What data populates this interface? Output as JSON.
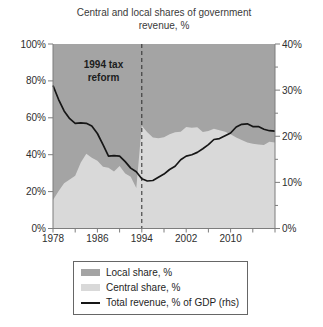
{
  "colors": {
    "background": "#ffffff",
    "local": "#a4a4a4",
    "central": "#d9d9d9",
    "line": "#161616",
    "dashed": "#2b2b2b",
    "axis": "#7d7d7d",
    "text": "#2e2e2e",
    "legend_border": "#666666"
  },
  "chart_data": {
    "type": "area",
    "stacked": true,
    "title": "Central and local shares of government\nrevenue, %",
    "x_range": [
      1978,
      2018
    ],
    "x_step": 1,
    "x_axis": {
      "tick_years": [
        1978,
        1986,
        1994,
        2002,
        2010
      ],
      "tick_labels": [
        "1978",
        "1986",
        "1994",
        "2002",
        "2010"
      ],
      "minor_tick_step_years": 4
    },
    "left_axis": {
      "min": 0,
      "max": 100,
      "tick_step": 20,
      "tick_labels": [
        "0%",
        "20%",
        "40%",
        "60%",
        "80%",
        "100%"
      ]
    },
    "right_axis": {
      "min": 0,
      "max": 40,
      "tick_step": 10,
      "minor_tick_step": 5,
      "tick_labels": [
        "0%",
        "10%",
        "20%",
        "30%",
        "40%"
      ]
    },
    "annotation": {
      "line1": "1994 tax",
      "line2": "reform",
      "year": 1994,
      "marker": "vertical-dashed-line"
    },
    "legend_position": "bottom",
    "series": [
      {
        "name": "Local share, %",
        "role": "area",
        "axis": "left",
        "values": [
          84.5,
          79.8,
          75.5,
          73.5,
          71.4,
          64.2,
          59.5,
          61.6,
          63.3,
          66.5,
          67.1,
          69.1,
          66.2,
          70.2,
          71.9,
          78.0,
          44.3,
          47.8,
          50.6,
          51.1,
          50.5,
          48.9,
          47.8,
          47.6,
          45.0,
          45.4,
          45.1,
          47.7,
          47.2,
          45.9,
          46.7,
          47.6,
          48.9,
          50.6,
          52.1,
          53.4,
          54.1,
          54.5,
          54.7,
          53.0,
          53.4
        ]
      },
      {
        "name": "Central share, %",
        "role": "area",
        "axis": "left",
        "values": [
          15.5,
          20.2,
          24.5,
          26.5,
          28.6,
          35.8,
          40.5,
          38.4,
          36.7,
          33.5,
          32.9,
          30.9,
          33.8,
          29.8,
          28.1,
          22.0,
          55.7,
          52.2,
          49.4,
          48.9,
          49.5,
          51.1,
          52.2,
          52.4,
          55.0,
          54.6,
          54.9,
          52.3,
          52.8,
          54.1,
          53.3,
          52.4,
          51.1,
          49.4,
          47.9,
          46.6,
          45.9,
          45.5,
          45.3,
          47.0,
          46.6
        ]
      },
      {
        "name": "Total revenue, % of GDP (rhs)",
        "role": "line",
        "axis": "right",
        "values": [
          31.0,
          28.0,
          25.5,
          23.8,
          22.8,
          22.9,
          22.8,
          22.2,
          20.6,
          18.2,
          15.7,
          15.8,
          15.7,
          14.5,
          13.1,
          12.3,
          10.8,
          10.3,
          10.4,
          11.1,
          11.8,
          12.8,
          13.5,
          14.9,
          15.7,
          16.0,
          16.5,
          17.3,
          18.2,
          19.3,
          19.5,
          20.1,
          20.7,
          22.0,
          22.6,
          22.7,
          22.1,
          22.1,
          21.5,
          21.2,
          21.1
        ]
      }
    ]
  }
}
